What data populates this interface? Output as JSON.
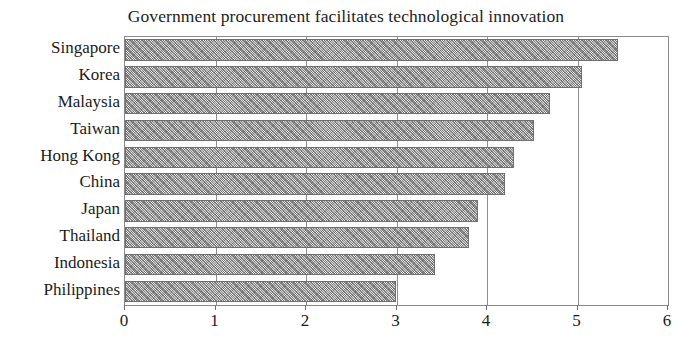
{
  "chart_data": {
    "type": "bar",
    "orientation": "horizontal",
    "title": "Government procurement facilitates technological innovation",
    "xlabel": "",
    "ylabel": "",
    "categories": [
      "Singapore",
      "Korea",
      "Malaysia",
      "Taiwan",
      "Hong Kong",
      "China",
      "Japan",
      "Thailand",
      "Indonesia",
      "Philippines"
    ],
    "values": [
      5.45,
      5.05,
      4.7,
      4.52,
      4.3,
      4.2,
      3.9,
      3.8,
      3.42,
      2.99
    ],
    "xlim": [
      0,
      6
    ],
    "xticks": [
      0,
      1,
      2,
      3,
      4,
      5,
      6
    ],
    "xtick_labels": [
      "0",
      "1",
      "2",
      "3",
      "4",
      "5",
      "6"
    ],
    "grid": "vertical",
    "legend": "none",
    "bar_fill": "#a9a9a9",
    "bar_pattern": "crosshatch",
    "bar_edge_color": "#6f6f6f",
    "axis_color": "#8a8a8a",
    "text_color": "#1b1b1b"
  }
}
